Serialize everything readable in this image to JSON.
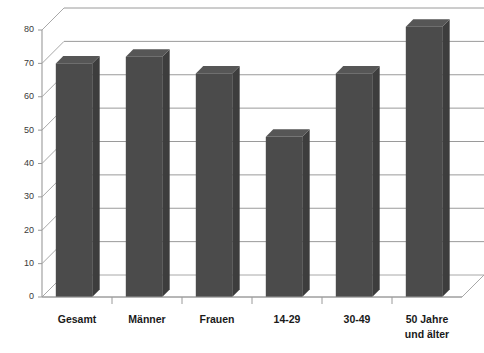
{
  "chart_data": {
    "type": "bar",
    "title": "",
    "subtitle": "",
    "xlabel": "",
    "ylabel": "",
    "categories": [
      "Gesamt",
      "Männer",
      "Frauen",
      "14-29",
      "30-49",
      "50 Jahre und älter"
    ],
    "category_lines": [
      [
        "Gesamt"
      ],
      [
        "Männer"
      ],
      [
        "Frauen"
      ],
      [
        "14-29"
      ],
      [
        "30-49"
      ],
      [
        "50 Jahre",
        "und älter"
      ]
    ],
    "values": [
      70,
      72,
      67,
      48,
      67,
      81
    ],
    "ylim": [
      0,
      80
    ],
    "ytick_step": 10,
    "yticks": [
      0,
      10,
      20,
      30,
      40,
      50,
      60,
      70,
      80
    ],
    "ytick_labels": [
      "0",
      "10",
      "20",
      "30",
      "40",
      "50",
      "60",
      "70",
      "80"
    ],
    "grid": true,
    "grid_axis": "y",
    "legend": false,
    "legend_position": "none",
    "style": "3d-column",
    "series": [
      {
        "name": "",
        "values": [
          70,
          72,
          67,
          48,
          67,
          81
        ]
      }
    ]
  },
  "colors": {
    "bar_front": "#4b4b4b",
    "bar_side": "#3d3d3d",
    "bar_top": "#565656",
    "gridline": "#9a9a9a",
    "axis": "#9a9a9a",
    "background": "#ffffff",
    "tick_text": "#3a3a3a",
    "category_text": "#1a1a1a"
  }
}
